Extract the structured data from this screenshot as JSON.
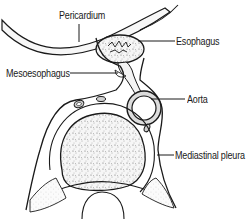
{
  "figure": {
    "type": "anatomical cross-section illustration",
    "labels": [
      {
        "id": "pericardium",
        "text": "Pericardium"
      },
      {
        "id": "esophagus",
        "text": "Esophagus"
      },
      {
        "id": "mesoesophagus",
        "text": "Mesoesophagus"
      },
      {
        "id": "aorta",
        "text": "Aorta"
      },
      {
        "id": "mediastinal_pleura",
        "text": "Mediastinal pleura"
      }
    ]
  },
  "colors": {
    "line": "#1a1a1a",
    "fill_light": "#f4f4f4",
    "fill_stipple": "#e8e8e8",
    "background": "#ffffff"
  }
}
